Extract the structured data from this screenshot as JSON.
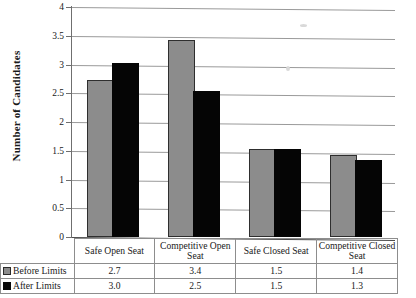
{
  "chart_data": {
    "type": "bar",
    "title": "",
    "xlabel": "",
    "ylabel": "Number of Candidates",
    "ylim": [
      0,
      4
    ],
    "ytick_labels": [
      "4",
      "3.5",
      "3",
      "2.5",
      "2",
      "1.5",
      "1",
      "0.5",
      "0"
    ],
    "ytick_values": [
      4,
      3.5,
      3,
      2.5,
      2,
      1.5,
      1,
      0.5,
      0
    ],
    "grid": true,
    "legend_position": "table-left",
    "categories": [
      "Safe Open Seat",
      "Competitive Open Seat",
      "Safe Closed Seat",
      "Competitive Closed Seat"
    ],
    "series": [
      {
        "name": "Before Limits",
        "color": "#8c8c8c",
        "values": [
          2.7,
          3.4,
          1.5,
          1.4
        ]
      },
      {
        "name": "After Limits",
        "color": "#050505",
        "values": [
          3.0,
          2.5,
          1.5,
          1.3
        ]
      }
    ]
  },
  "table": {
    "category_labels": [
      "Safe Open Seat",
      "Competitive Open Seat",
      "Safe Closed Seat",
      "Competitive Closed Seat"
    ],
    "rows": [
      {
        "label": "Before Limits",
        "marker": "gray-square-icon",
        "cells": [
          "2.7",
          "3.4",
          "1.5",
          "1.4"
        ]
      },
      {
        "label": "After Limits",
        "marker": "black-square-icon",
        "cells": [
          "3.0",
          "2.5",
          "1.5",
          "1.3"
        ]
      }
    ]
  }
}
